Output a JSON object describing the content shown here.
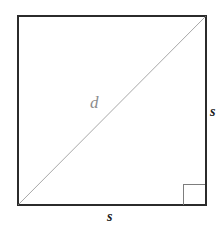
{
  "figure": {
    "type": "geometry-diagram",
    "background_color": "#ffffff",
    "shape": {
      "name": "square",
      "stroke_color": "#2b2b2b",
      "stroke_width": 1.6,
      "fill": "none",
      "x": 17,
      "y": 15,
      "width": 189,
      "height": 190
    },
    "diagonal": {
      "name": "diagonal",
      "stroke_color": "#a6a6a6",
      "stroke_width": 1,
      "x1": 17,
      "y1": 205,
      "x2": 206,
      "y2": 15
    },
    "right_angle_mark": {
      "name": "right-angle-mark",
      "stroke_color": "#7d7d7d",
      "stroke_width": 1.2,
      "x": 183,
      "y": 184,
      "size": 22
    },
    "labels": {
      "diagonal_label": "d",
      "side_right_label": "s",
      "side_bottom_label": "s"
    }
  }
}
